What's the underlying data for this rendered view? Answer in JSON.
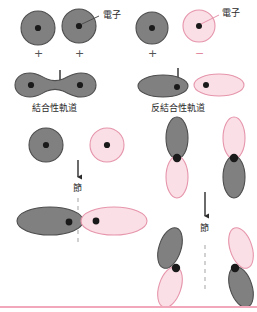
{
  "figure": {
    "title_present": false,
    "language": "ja",
    "topic": "molecular-orbital-formation"
  },
  "colors": {
    "gray_fill": "#808080",
    "gray_stroke": "#4d4d4d",
    "pink_fill": "#fadfe6",
    "pink_stroke": "#e695ab",
    "pink_rule": "#f2a8ba",
    "dot": "#1a1a1a",
    "text": "#2b2b2b",
    "arrow": "#2b2b2b",
    "plus_sign": "#545454",
    "minus_sign": "#e28a9f"
  },
  "labels": {
    "electron_left": "電子",
    "electron_right": "電子",
    "bonding_orbital": "結合性軌道",
    "antibonding_orbital": "反結合性軌道",
    "node_s": "節",
    "node_p": "節",
    "plus_left_1": "+",
    "plus_left_2": "+",
    "plus_right_1": "+",
    "minus_right_1": "−"
  },
  "panels": [
    {
      "id": "bonding-s",
      "caption": "結合性軌道",
      "inputs": [
        {
          "orbital": "s",
          "phase": "+",
          "color": "gray",
          "electron": true
        },
        {
          "orbital": "s",
          "phase": "+",
          "color": "gray",
          "electron": true
        }
      ],
      "result": {
        "shape": "peanut",
        "color": "gray",
        "electrons": 2,
        "node": false
      }
    },
    {
      "id": "antibonding-s",
      "caption": "反結合性軌道",
      "inputs": [
        {
          "orbital": "s",
          "phase": "+",
          "color": "gray",
          "electron": true
        },
        {
          "orbital": "s",
          "phase": "−",
          "color": "pink",
          "electron": true
        }
      ],
      "result": {
        "shape": "two-ellipses",
        "colors": [
          "gray",
          "pink"
        ],
        "electrons": 2,
        "node": true
      }
    },
    {
      "id": "antibonding-s-detail",
      "caption": "節",
      "inputs": [
        {
          "orbital": "s",
          "phase": "+",
          "color": "gray",
          "electron": true
        },
        {
          "orbital": "s",
          "phase": "−",
          "color": "pink",
          "electron": true
        }
      ],
      "result": {
        "shape": "two-ellipses-split",
        "colors": [
          "gray",
          "pink"
        ],
        "electrons": 2,
        "node": true
      }
    },
    {
      "id": "antibonding-p",
      "caption": "節",
      "inputs": [
        {
          "orbital": "p",
          "lobes": [
            "gray",
            "pink"
          ],
          "electron": true
        },
        {
          "orbital": "p",
          "lobes": [
            "pink",
            "gray"
          ],
          "electron": true
        }
      ],
      "result": {
        "shape": "two-tilted-p",
        "colors": [
          "gray",
          "pink"
        ],
        "electrons": 2,
        "node": true
      }
    }
  ],
  "annotations": {
    "arrows": [
      {
        "name": "arrow-bonding-s",
        "direction": "down"
      },
      {
        "name": "arrow-antibonding-s",
        "direction": "down"
      },
      {
        "name": "arrow-node-s",
        "direction": "down"
      },
      {
        "name": "arrow-node-p",
        "direction": "down"
      }
    ],
    "node_dashed_lines": [
      {
        "name": "node-line-s",
        "orientation": "vertical",
        "style": "dashed"
      },
      {
        "name": "node-line-p",
        "orientation": "vertical",
        "style": "dashed"
      }
    ],
    "leader_lines": [
      {
        "name": "leader-electron-left"
      },
      {
        "name": "leader-electron-right"
      }
    ]
  }
}
